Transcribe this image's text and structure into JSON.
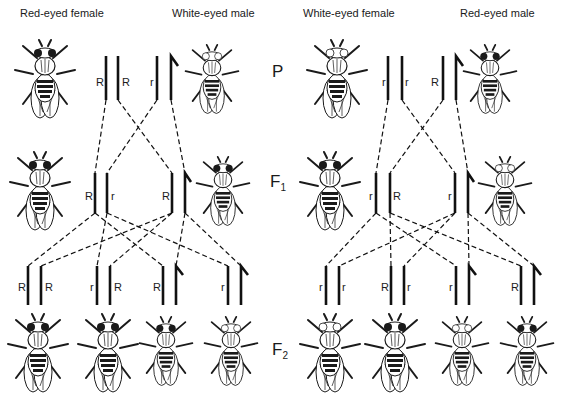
{
  "generations": {
    "p": "P",
    "f1": "F",
    "f1_sub": "1",
    "f2": "F",
    "f2_sub": "2"
  },
  "left_cross": {
    "parents": [
      {
        "label": "Red-eyed female",
        "alleles": [
          "R",
          "R"
        ],
        "eye": "red"
      },
      {
        "label": "White-eyed male",
        "alleles": [
          "r",
          "Y"
        ],
        "eye": "white"
      }
    ],
    "f1": [
      {
        "sex": "female",
        "alleles": [
          "R",
          "r"
        ],
        "eye": "red"
      },
      {
        "sex": "male",
        "alleles": [
          "R",
          "Y"
        ],
        "eye": "red"
      }
    ],
    "f2": [
      {
        "sex": "female",
        "alleles": [
          "R",
          "R"
        ],
        "eye": "red"
      },
      {
        "sex": "female",
        "alleles": [
          "r",
          "R"
        ],
        "eye": "red"
      },
      {
        "sex": "male",
        "alleles": [
          "R",
          "Y"
        ],
        "eye": "red"
      },
      {
        "sex": "male",
        "alleles": [
          "r",
          "Y"
        ],
        "eye": "white"
      }
    ]
  },
  "right_cross": {
    "parents": [
      {
        "label": "White-eyed female",
        "alleles": [
          "r",
          "r"
        ],
        "eye": "white"
      },
      {
        "label": "Red-eyed male",
        "alleles": [
          "R",
          "Y"
        ],
        "eye": "red"
      }
    ],
    "f1": [
      {
        "sex": "female",
        "alleles": [
          "r",
          "R"
        ],
        "eye": "red"
      },
      {
        "sex": "male",
        "alleles": [
          "r",
          "Y"
        ],
        "eye": "white"
      }
    ],
    "f2": [
      {
        "sex": "female",
        "alleles": [
          "r",
          "r"
        ],
        "eye": "white"
      },
      {
        "sex": "female",
        "alleles": [
          "R",
          "r"
        ],
        "eye": "red"
      },
      {
        "sex": "male",
        "alleles": [
          "r",
          "Y"
        ],
        "eye": "white"
      },
      {
        "sex": "male",
        "alleles": [
          "R",
          "Y"
        ],
        "eye": "red"
      }
    ]
  },
  "colors": {
    "ink": "#1a1a1a",
    "background": "#ffffff"
  }
}
